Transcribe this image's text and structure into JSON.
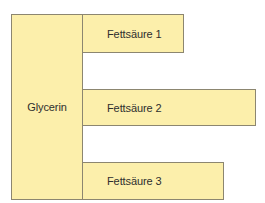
{
  "diagram": {
    "type": "triglyceride-structure",
    "colors": {
      "fill": "#fcefab",
      "border": "#8c8670",
      "text": "#2e2e2e"
    },
    "backbone": {
      "label": "Glycerin"
    },
    "fatty_acids": [
      {
        "label": "Fettsäure 1"
      },
      {
        "label": "Fettsäure 2"
      },
      {
        "label": "Fettsäure 3"
      }
    ]
  }
}
